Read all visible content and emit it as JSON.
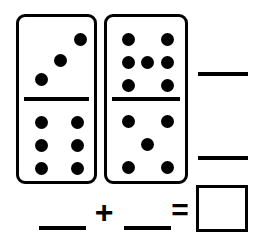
{
  "worksheet": {
    "type": "domino-addition-worksheet",
    "background_color": "#ffffff",
    "ink_color": "#000000"
  },
  "dominoes": [
    {
      "name": "left-domino",
      "top_half": {
        "pip_count": 3,
        "pattern": "diagonal",
        "pips": [
          {
            "x": 22,
            "y": 62
          },
          {
            "x": 41,
            "y": 43
          },
          {
            "x": 61,
            "y": 22
          }
        ]
      },
      "bottom_half": {
        "pip_count": 6,
        "pattern": "two-columns-of-three",
        "pips": [
          {
            "x": 22,
            "y": 23
          },
          {
            "x": 58,
            "y": 23
          },
          {
            "x": 22,
            "y": 46
          },
          {
            "x": 58,
            "y": 46
          },
          {
            "x": 22,
            "y": 69
          },
          {
            "x": 58,
            "y": 69
          }
        ]
      },
      "total": 9
    },
    {
      "name": "right-domino",
      "top_half": {
        "pip_count": 7,
        "pattern": "two-columns-of-three-plus-center",
        "pips": [
          {
            "x": 21,
            "y": 22
          },
          {
            "x": 60,
            "y": 22
          },
          {
            "x": 21,
            "y": 45
          },
          {
            "x": 40,
            "y": 45
          },
          {
            "x": 60,
            "y": 45
          },
          {
            "x": 21,
            "y": 68
          },
          {
            "x": 60,
            "y": 68
          }
        ]
      },
      "bottom_half": {
        "pip_count": 5,
        "pattern": "quincunx",
        "pips": [
          {
            "x": 21,
            "y": 22
          },
          {
            "x": 60,
            "y": 22
          },
          {
            "x": 40,
            "y": 45
          },
          {
            "x": 21,
            "y": 68
          },
          {
            "x": 60,
            "y": 68
          }
        ]
      },
      "total": 12
    }
  ],
  "side_rules": {
    "top_label": "",
    "bottom_label": ""
  },
  "equation": {
    "addend_1": "",
    "plus_symbol": "+",
    "addend_2": "",
    "equals_symbol": "=",
    "answer": ""
  }
}
